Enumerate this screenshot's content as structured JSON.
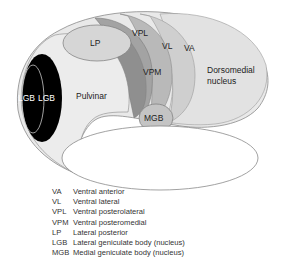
{
  "diagram": {
    "regions": [
      {
        "id": "VA",
        "label": "VA",
        "color": "#cfcfcf"
      },
      {
        "id": "VL",
        "label": "VL",
        "color": "#b9b9b9"
      },
      {
        "id": "VPL",
        "label": "VPL",
        "color": "#a3a3a3"
      },
      {
        "id": "VPM",
        "label": "VPM",
        "color": "#8f8f8f"
      },
      {
        "id": "LP",
        "label": "LP",
        "color": "#d6d6d6"
      },
      {
        "id": "Pulvinar",
        "label": "Pulvinar",
        "color": "#ececec"
      },
      {
        "id": "LGB_outer",
        "label": "LGB",
        "color": "#000000"
      },
      {
        "id": "LGB_inner",
        "label": "LGB",
        "color": "#000000"
      },
      {
        "id": "MGB",
        "label": "MGB",
        "color": "#c4c4c4"
      },
      {
        "id": "Dorsomedial",
        "label_line1": "Dorsomedial",
        "label_line2": "nucleus",
        "color": "#e4e4e4"
      }
    ]
  },
  "legend": [
    {
      "abbr": "VA",
      "text": "Ventral anterior"
    },
    {
      "abbr": "VL",
      "text": "Ventral lateral"
    },
    {
      "abbr": "VPL",
      "text": "Ventral posterolateral"
    },
    {
      "abbr": "VPM",
      "text": "Ventral posteromedial"
    },
    {
      "abbr": "LP",
      "text": "Lateral posterior"
    },
    {
      "abbr": "LGB",
      "text": "Lateral geniculate body (nucleus)"
    },
    {
      "abbr": "MGB",
      "text": "Medial geniculate body (nucleus)"
    }
  ]
}
